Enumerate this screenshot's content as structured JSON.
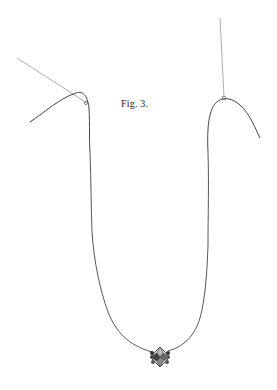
{
  "figure": {
    "caption": "Fig. 3.",
    "colors": {
      "background": "#ffffff",
      "thread": "#444444",
      "support_lines": "#999999"
    },
    "elements": [
      "left-support-line",
      "left-hook-curve",
      "right-support-line",
      "right-hook-curve",
      "u-thread",
      "pendant-bead"
    ]
  }
}
